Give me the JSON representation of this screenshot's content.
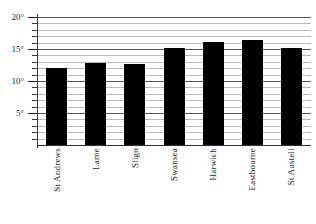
{
  "chart_data": {
    "type": "bar",
    "title": "",
    "subtitle": "",
    "xlabel": "",
    "ylabel": "",
    "categories": [
      "St Andrews",
      "Larne",
      "Sligo",
      "Swansea",
      "Harwich",
      "Eastbourne",
      "St Austell"
    ],
    "values": [
      12.0,
      12.8,
      12.7,
      15.2,
      16.1,
      16.4,
      15.1
    ],
    "ylim": [
      0,
      20
    ],
    "y_tick_labels": [
      "20°",
      "15°",
      "10°",
      "5°"
    ],
    "y_tick_values": [
      20,
      15,
      10,
      5
    ],
    "y_minor_step": 1,
    "grid": true,
    "grid_axis": "y",
    "legend": "none",
    "bar_color": "#000000",
    "grid_color": "#b9b9b9",
    "major_grid_color": "#565656",
    "axis_color": "#2e2e2e"
  }
}
